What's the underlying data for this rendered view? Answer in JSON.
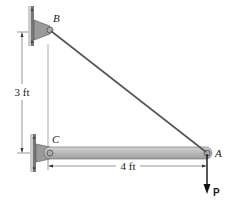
{
  "diagram": {
    "points": {
      "B": {
        "label": "B"
      },
      "C": {
        "label": "C"
      },
      "A": {
        "label": "A"
      }
    },
    "dimensions": {
      "vertical": "3 ft",
      "horizontal": "4 ft"
    },
    "load": {
      "label": "P"
    },
    "colors": {
      "beam": "#b9b9b9",
      "support": "#9a9a9a",
      "cable": "#555555",
      "line": "#333333"
    }
  }
}
